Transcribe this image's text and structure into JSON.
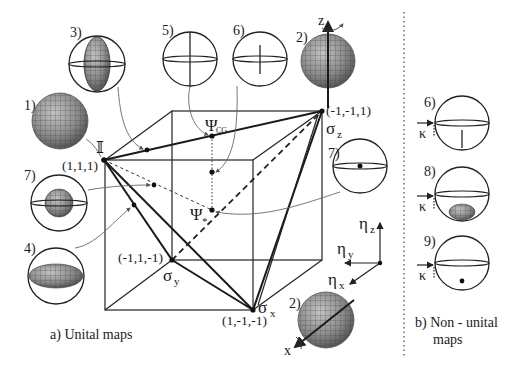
{
  "figure": {
    "vertices": {
      "identity": {
        "symbol": "𝕀",
        "coord": "(1,1,1)"
      },
      "sigma_z": {
        "symbol": "σ",
        "sub": "z",
        "coord": "(-1,-1,1)"
      },
      "sigma_y": {
        "symbol": "σ",
        "sub": "y",
        "coord": "(-1,1,-1)"
      },
      "sigma_x": {
        "symbol": "σ",
        "sub": "x",
        "coord": "(1,-1,-1)"
      }
    },
    "points": {
      "psi_cg": {
        "symbol": "Ψ",
        "sub": "CG"
      },
      "psi_star": {
        "symbol": "Ψ",
        "sub": "*"
      }
    },
    "axes": {
      "eta_z": {
        "symbol": "η",
        "sub": "z"
      },
      "eta_y": {
        "symbol": "η",
        "sub": "y"
      },
      "eta_x": {
        "symbol": "η",
        "sub": "x"
      }
    },
    "sphere_labels": {
      "s1": "1)",
      "s2_top": "2)",
      "s2_bottom": "2)",
      "s3": "3)",
      "s4": "4)",
      "s5": "5)",
      "s6_top": "6)",
      "s7_left": "7)",
      "s7_right": "7)",
      "s6_right": "6)",
      "s8": "8)",
      "s9": "9)"
    },
    "rotation_axes": {
      "z": "z",
      "x": "x"
    },
    "kappa": {
      "symbol": "κ"
    },
    "captions": {
      "unital": "a)  Unital maps",
      "non_unital_1": "b) Non - unital",
      "non_unital_2": "maps"
    },
    "colors": {
      "ink": "#1a1a1a",
      "sphere_fill": "#8c8c8c",
      "sphere_grid": "#555555",
      "leader": "#666666"
    }
  }
}
